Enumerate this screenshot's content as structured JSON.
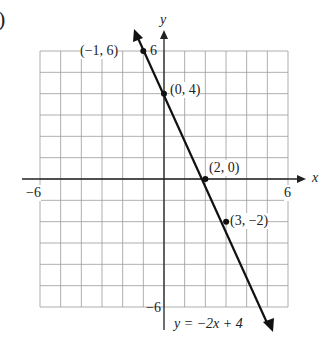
{
  "figure_label_fragment": ")",
  "chart_data": {
    "type": "line",
    "title": "",
    "equation": "y = −2x + 4",
    "xlabel": "x",
    "ylabel": "y",
    "xlim": [
      -6,
      6
    ],
    "ylim": [
      -6,
      6
    ],
    "grid": true,
    "tick_labels": {
      "x": [
        "−6",
        "6"
      ],
      "y": [
        "6",
        "−6"
      ]
    },
    "points": [
      {
        "x": -1,
        "y": 6,
        "label": "(−1, 6)"
      },
      {
        "x": 0,
        "y": 4,
        "label": "(0, 4)"
      },
      {
        "x": 2,
        "y": 0,
        "label": "(2, 0)"
      },
      {
        "x": 3,
        "y": -2,
        "label": "(3, −2)"
      }
    ],
    "line": {
      "slope": -2,
      "intercept": 4,
      "color": "#111111"
    }
  },
  "labels": {
    "xtick_min": "−6",
    "xtick_max": "6",
    "ytick_max": "6",
    "ytick_min": "−6",
    "x_axis": "x",
    "y_axis": "y",
    "p1": "(−1, 6)",
    "p2": "(0, 4)",
    "p3": "(2, 0)",
    "p4": "(3, −2)",
    "equation": "y = −2x + 4"
  }
}
